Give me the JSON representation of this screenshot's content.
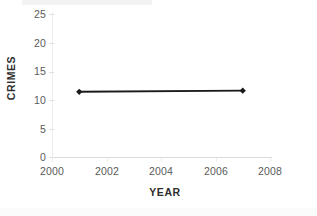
{
  "chart_data": {
    "type": "line",
    "title": "",
    "xlabel": "YEAR",
    "ylabel": "CRIMES",
    "xlim": [
      2000,
      2008
    ],
    "ylim": [
      0,
      25
    ],
    "grid": false,
    "legend": "none",
    "x_ticks": [
      "2000",
      "2002",
      "2004",
      "2006",
      "2008"
    ],
    "y_ticks": [
      "0",
      "5",
      "10",
      "15",
      "20",
      "25"
    ],
    "series": [
      {
        "name": "Crimes",
        "color": "#1a1a1a",
        "marker": "diamond",
        "x": [
          2001,
          2007
        ],
        "values": [
          11.4,
          11.6
        ],
        "points": [
          {
            "x": 2001,
            "y": 11.4
          },
          {
            "x": 2007,
            "y": 11.6
          }
        ]
      }
    ]
  },
  "axes": {
    "y_title": "CRIMES",
    "x_title": "YEAR",
    "y_tick_labels": [
      "25",
      "20",
      "15",
      "10",
      "5",
      "0"
    ],
    "x_tick_labels": [
      "2000",
      "2002",
      "2004",
      "2006",
      "2008"
    ]
  },
  "colors": {
    "series": "#1a1a1a",
    "axis_line": "#dcdcdc",
    "tick_text": "#5a5a5a",
    "title_text": "#2e2e2e",
    "background": "#ffffff"
  }
}
